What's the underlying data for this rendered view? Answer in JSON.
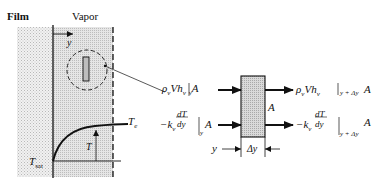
{
  "labels": {
    "film": "Film",
    "vapor": "Vapor",
    "y_axis": "y",
    "T_e": "T",
    "T_e_sub": "e",
    "T_sat": "T",
    "T_sat_sub": "sat",
    "T": "T",
    "area": "A",
    "delta_y": "Δy",
    "y_position": "y"
  },
  "equations": {
    "convection_in": "ρ_v V h_v |_y A",
    "conduction_in": "−k_v (dT/dy)|_y A",
    "convection_out": "ρ_v V h_v |_{y+Δy} A",
    "conduction_out": "−k_v (dT/dy)|_{y+Δy} A"
  },
  "eq_parts": {
    "rho": "ρ",
    "v": "v",
    "V": "V",
    "h": "h",
    "A": "A",
    "minus_k": "−k",
    "dT": "dT",
    "dy": "dy",
    "y": "y",
    "y_plus": "y + Δy"
  },
  "colors": {
    "ink": "#111111",
    "film_fill": "#e9e9e9",
    "vapor_fill": "#dcdcdc",
    "block_fill": "#d4d4d4"
  }
}
